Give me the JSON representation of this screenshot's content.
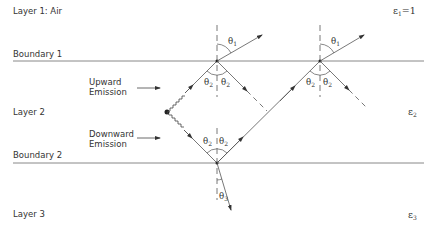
{
  "layers": {
    "layer1": {
      "label": "Layer 1: Air",
      "epsilon": "ε",
      "epsilon_sub": "1",
      "epsilon_suffix": "=1"
    },
    "layer2": {
      "label": "Layer 2",
      "epsilon": "ε",
      "epsilon_sub": "2"
    },
    "layer3": {
      "label": "Layer 3",
      "epsilon": "ε",
      "epsilon_sub": "3"
    }
  },
  "boundaries": {
    "b1": "Boundary 1",
    "b2": "Boundary 2"
  },
  "emissions": {
    "upward_line1": "Upward",
    "upward_line2": "Emission",
    "downward_line1": "Downward",
    "downward_line2": "Emission"
  },
  "angles": {
    "theta": "θ",
    "s1": "1",
    "s2": "2",
    "s3": "3"
  },
  "colors": {
    "line": "#555555",
    "boundary": "#888888",
    "text": "#333333"
  }
}
